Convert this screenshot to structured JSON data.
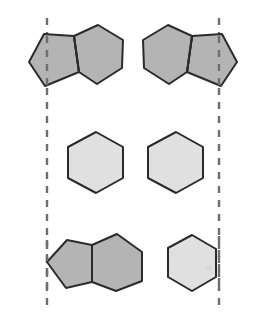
{
  "figure": {
    "canvas": {
      "width": 259,
      "height": 328,
      "background": "#ffffff"
    },
    "palette": {
      "dark_fill": "#b4b4b4",
      "light_fill": "#e0e0e0",
      "outline": "#2b2b2b",
      "dashed_line": "#6e6e6e"
    },
    "mirror_lines": [
      {
        "name": "left-mirror-line",
        "label": "left dashed symmetry axis",
        "x": 47,
        "y_top": 18,
        "y_bottom": 306,
        "style": "dashed"
      },
      {
        "name": "right-mirror-line",
        "label": "right dashed symmetry axis",
        "x": 219,
        "y_top": 18,
        "y_bottom": 306,
        "style": "dashed"
      }
    ],
    "rows": [
      {
        "name": "top-row",
        "shapes": [
          {
            "name": "top-left-pentagon-hexagon",
            "type": "pentagon-hexagon-fused",
            "shade": "dark",
            "fill": "#b4b4b4",
            "orientation": "pentagon-left",
            "pentagon_points": "29,62 44,34 74,36 79,72 45,86",
            "hexagon_points": "74,36 98,25 123,40 122,68 97,84 79,72",
            "fusion_bond": "74,36 79,72"
          },
          {
            "name": "top-right-hexagon-pentagon",
            "type": "pentagon-hexagon-fused",
            "shade": "dark",
            "fill": "#b4b4b4",
            "orientation": "pentagon-right",
            "pentagon_points": "237,62 222,34 192,36 187,72 221,86",
            "hexagon_points": "192,36 168,25 143,40 144,68 169,84 187,72",
            "fusion_bond": "192,36 187,72"
          }
        ]
      },
      {
        "name": "middle-row",
        "shapes": [
          {
            "name": "middle-left-hexagon",
            "type": "hexagon",
            "shade": "light",
            "fill": "#e0e0e0",
            "points": "68,147 96,132 123,147 123,178 96,193 68,178"
          },
          {
            "name": "middle-right-hexagon",
            "type": "hexagon",
            "shade": "light",
            "fill": "#e0e0e0",
            "points": "148,147 176,132 203,147 203,178 176,193 148,178"
          }
        ]
      },
      {
        "name": "bottom-row",
        "shapes": [
          {
            "name": "bottom-left-pentagon-hexagon",
            "type": "pentagon-hexagon-fused",
            "shade": "dark",
            "fill": "#b4b4b4",
            "orientation": "pentagon-left-tilted",
            "pentagon_points": "47,262 67,240 92,245 92,282 66,288",
            "hexagon_points": "92,245 117,234 142,252 142,281 116,291 92,282",
            "fusion_bond": "92,245 92,282"
          },
          {
            "name": "bottom-right-hexagon",
            "type": "hexagon",
            "shade": "light",
            "fill": "#e0e0e0",
            "points": "168,248 192,235 216,249 216,277 192,291 168,277"
          }
        ]
      }
    ]
  }
}
